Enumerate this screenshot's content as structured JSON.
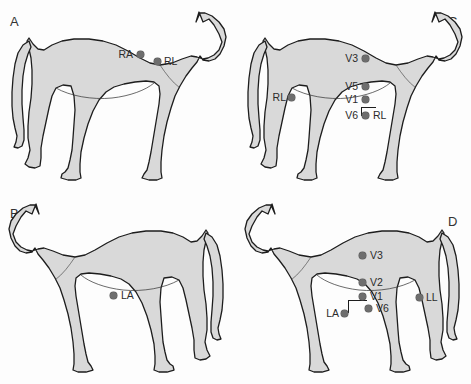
{
  "figure": {
    "background_color": "#fdfdfd",
    "body_fill_color": "#d9d9d9",
    "outline_color": "#1d1d1d",
    "marker_color": "#6e6e6e",
    "label_color": "#2b2b2b"
  },
  "panels": [
    {
      "id": "A",
      "letter": "A",
      "letter_position": "top-left",
      "orientation": "facing-right",
      "markers": [
        {
          "name": "RA",
          "label": "RA",
          "label_side": "left",
          "x": 140,
          "y": 54
        },
        {
          "name": "RL",
          "label": "RL",
          "label_side": "right",
          "x": 157,
          "y": 61
        }
      ]
    },
    {
      "id": "B",
      "letter": "B",
      "letter_position": "top-left",
      "orientation": "facing-left",
      "markers": [
        {
          "name": "LA",
          "label": "LA",
          "label_side": "right",
          "x": 113,
          "y": 295
        }
      ]
    },
    {
      "id": "C",
      "letter": "C",
      "letter_position": "top-right",
      "orientation": "facing-right",
      "markers": [
        {
          "name": "V3",
          "label": "V3",
          "label_side": "left",
          "x": 365,
          "y": 58
        },
        {
          "name": "V5",
          "label": "V5",
          "label_side": "left",
          "x": 365,
          "y": 86
        },
        {
          "name": "V1",
          "label": "V1",
          "label_side": "left",
          "x": 365,
          "y": 99
        },
        {
          "name": "V6",
          "label": "V6",
          "label_side": "left",
          "x": 365,
          "y": 115
        },
        {
          "name": "RL-right",
          "label": "RL",
          "label_side": "right",
          "x": 369,
          "y": 115
        },
        {
          "name": "RL-flank",
          "label": "RL",
          "label_side": "left",
          "x": 291,
          "y": 97
        }
      ]
    },
    {
      "id": "D",
      "letter": "D",
      "letter_position": "top-right",
      "orientation": "facing-left",
      "markers": [
        {
          "name": "V3",
          "label": "V3",
          "label_side": "right",
          "x": 362,
          "y": 255
        },
        {
          "name": "V2",
          "label": "V2",
          "label_side": "right",
          "x": 362,
          "y": 282
        },
        {
          "name": "V1",
          "label": "V1",
          "label_side": "right",
          "x": 362,
          "y": 296
        },
        {
          "name": "V6",
          "label": "V6",
          "label_side": "right",
          "x": 368,
          "y": 308
        },
        {
          "name": "LA",
          "label": "LA",
          "label_side": "left",
          "x": 344,
          "y": 313
        },
        {
          "name": "LL",
          "label": "LL",
          "label_side": "right",
          "x": 419,
          "y": 297
        }
      ]
    }
  ]
}
